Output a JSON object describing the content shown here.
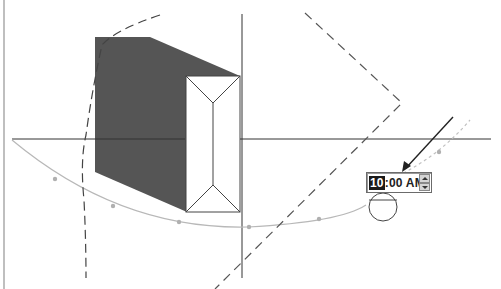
{
  "diagram": {
    "time_control": {
      "value": "10:00 AM",
      "hour_selected": "10",
      "rest": ":00 AM",
      "spinner_up": "increment",
      "spinner_down": "decrement"
    },
    "colors": {
      "shadow": "#555555",
      "axis": "#333333",
      "sun_path": "#b5b5b5",
      "dashed": "#555555",
      "building_outline": "#444444"
    },
    "elements": [
      "horizontal-axis",
      "vertical-axis",
      "building-shadow",
      "building-roof",
      "sun-path-arc",
      "dashed-rhombus",
      "dashed-curve",
      "pointer-arrow",
      "compass-circle"
    ]
  }
}
